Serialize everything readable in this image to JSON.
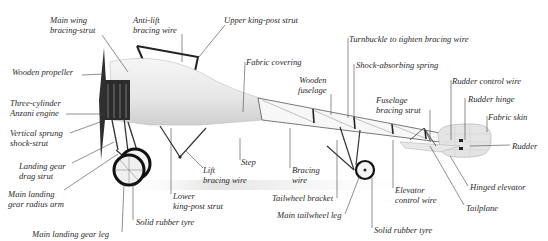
{
  "diagram": {
    "labels": [
      {
        "id": "main-wing-bracing-strut",
        "text": "Main wing\nbracing-strut",
        "x": 50,
        "y": 15,
        "align": "left"
      },
      {
        "id": "anti-lift-bracing-wire",
        "text": "Anti-lift\nbracing wire",
        "x": 133,
        "y": 15,
        "align": "left"
      },
      {
        "id": "upper-king-post-strut",
        "text": "Upper king-post strut",
        "x": 224,
        "y": 15,
        "align": "left"
      },
      {
        "id": "wooden-propeller",
        "text": "Wooden propeller",
        "x": 12,
        "y": 67,
        "align": "left"
      },
      {
        "id": "fabric-covering",
        "text": "Fabric covering",
        "x": 246,
        "y": 57,
        "align": "left"
      },
      {
        "id": "turnbuckle",
        "text": "Turnbuckle to tighten bracing wire",
        "x": 349,
        "y": 34,
        "align": "left"
      },
      {
        "id": "shock-absorbing-spring",
        "text": "Shock-absorbing spring",
        "x": 356,
        "y": 60,
        "align": "left"
      },
      {
        "id": "wooden-fuselage",
        "text": "Wooden\nfuselage",
        "x": 298,
        "y": 75,
        "align": "left"
      },
      {
        "id": "rudder-control-wire",
        "text": "Rudder control wire",
        "x": 452,
        "y": 76,
        "align": "left"
      },
      {
        "id": "three-cylinder-engine",
        "text": "Three-cylinder\nAnzani engine",
        "x": 10,
        "y": 98,
        "align": "left"
      },
      {
        "id": "rudder-hinge",
        "text": "Rudder hinge",
        "x": 468,
        "y": 94,
        "align": "left"
      },
      {
        "id": "fuselage-bracing-strut",
        "text": "Fuselage\nbracing strut",
        "x": 376,
        "y": 95,
        "align": "left"
      },
      {
        "id": "fabric-skin",
        "text": "Fabric skin",
        "x": 488,
        "y": 112,
        "align": "left"
      },
      {
        "id": "vertical-sprung-shock-strut",
        "text": "Vertical sprung\nshock-strut",
        "x": 10,
        "y": 128,
        "align": "left"
      },
      {
        "id": "rudder",
        "text": "Rudder",
        "x": 512,
        "y": 141,
        "align": "left"
      },
      {
        "id": "step",
        "text": "Step",
        "x": 241,
        "y": 157,
        "align": "left"
      },
      {
        "id": "lift-bracing-wire",
        "text": "Lift\nbracing wire",
        "x": 203,
        "y": 165,
        "align": "left"
      },
      {
        "id": "bracing-wire",
        "text": "Bracing\nwire",
        "x": 292,
        "y": 165,
        "align": "left"
      },
      {
        "id": "landing-gear-drag-strut",
        "text": "Landing gear\ndrag strut",
        "x": 19,
        "y": 161,
        "align": "left"
      },
      {
        "id": "elevator-control-wire",
        "text": "Elevator\ncontrol wire",
        "x": 395,
        "y": 185,
        "align": "left"
      },
      {
        "id": "hinged-elevator",
        "text": "Hinged elevator",
        "x": 470,
        "y": 182,
        "align": "left"
      },
      {
        "id": "main-landing-gear-radius-arm",
        "text": "Main landing\ngear radius arm",
        "x": 8,
        "y": 189,
        "align": "left"
      },
      {
        "id": "lower-king-post-strut",
        "text": "Lower\nking-post strut",
        "x": 173,
        "y": 191,
        "align": "left"
      },
      {
        "id": "tailwheel-bracket",
        "text": "Tailwheel bracket",
        "x": 272,
        "y": 193,
        "align": "left"
      },
      {
        "id": "tailplane",
        "text": "Tailplane",
        "x": 466,
        "y": 203,
        "align": "left"
      },
      {
        "id": "main-tailwheel-leg",
        "text": "Main tailwheel leg",
        "x": 277,
        "y": 210,
        "align": "left"
      },
      {
        "id": "solid-rubber-tyre-front",
        "text": "Solid rubber tyre",
        "x": 136,
        "y": 217,
        "align": "left"
      },
      {
        "id": "solid-rubber-tyre-rear",
        "text": "Solid rubber tyre",
        "x": 374,
        "y": 225,
        "align": "left"
      },
      {
        "id": "main-landing-gear-leg",
        "text": "Main landing gear leg",
        "x": 32,
        "y": 229,
        "align": "left"
      }
    ]
  }
}
